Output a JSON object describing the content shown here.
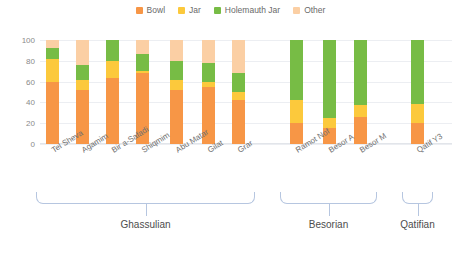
{
  "chart_data": {
    "type": "bar",
    "title": "",
    "subtitle": "",
    "xlabel": "",
    "ylabel": "",
    "stacked": true,
    "stack_mode": "percent",
    "grid": true,
    "legend_position": "top-center",
    "ylim": [
      0,
      100
    ],
    "yticks": [
      "0",
      "20",
      "40",
      "60",
      "80",
      "100"
    ],
    "ytick_values": [
      0,
      20,
      40,
      60,
      80,
      100
    ],
    "categories": [
      "Tel Sheva",
      "Agamim",
      "Bir a-Safadi",
      "Shiqmim",
      "Abu Matar",
      "Gilat",
      "Grar",
      "Ramot Nof",
      "Besor A",
      "Besor M",
      "Qatif Y3"
    ],
    "series": [
      {
        "name": "Bowl",
        "color": "#F79646",
        "values": [
          60,
          52,
          63,
          68,
          52,
          55,
          42,
          20,
          15,
          26,
          20
        ]
      },
      {
        "name": "Jar",
        "color": "#FCC93C",
        "values": [
          22,
          10,
          17,
          2,
          10,
          5,
          8,
          22,
          10,
          12,
          18
        ]
      },
      {
        "name": "Holemauth Jar",
        "color": "#77BC45",
        "values": [
          10,
          14,
          20,
          17,
          18,
          18,
          18,
          58,
          75,
          62,
          62
        ]
      },
      {
        "name": "Other",
        "color": "#FBCFA4",
        "values": [
          8,
          24,
          0,
          13,
          20,
          22,
          32,
          0,
          0,
          0,
          0
        ]
      }
    ],
    "groups": [
      {
        "label": "Ghassulian",
        "members": [
          "Tel Sheva",
          "Agamim",
          "Bir a-Safadi",
          "Shiqmim",
          "Abu Matar",
          "Gilat",
          "Grar"
        ]
      },
      {
        "label": "Besorian",
        "members": [
          "Ramot Nof",
          "Besor A",
          "Besor M"
        ]
      },
      {
        "label": "Qatifian",
        "members": [
          "Qatif Y3"
        ]
      }
    ]
  },
  "colors": {
    "bowl": "#F79646",
    "jar": "#FCC93C",
    "holemauth_jar": "#77BC45",
    "other": "#FBCFA4",
    "gridline": "#eceef2",
    "bracket": "#b6c6e0",
    "tick_text": "#8a8a8a",
    "label_text": "#6f6f6f",
    "legend_text": "#6a6a6a",
    "group_text": "#4d4d4d",
    "background": "#ffffff"
  }
}
